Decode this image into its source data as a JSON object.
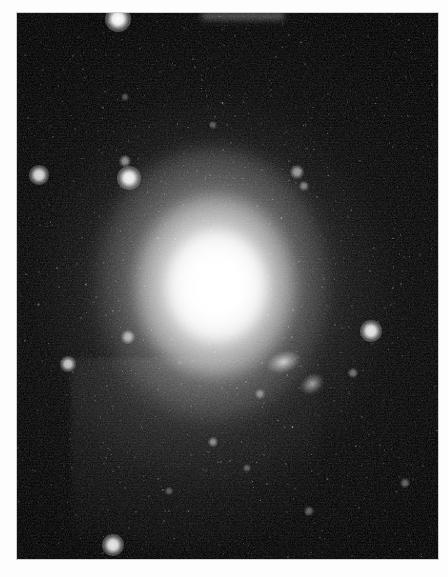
{
  "image": {
    "kind": "astronomical-photograph",
    "subject": "elliptical galaxy",
    "orientation": "portrait",
    "width": 448,
    "height": 577,
    "border": {
      "style": "white photographic matte",
      "color": "#fdfdfd",
      "edge_color": "#cfcfcf",
      "left": 17,
      "top": 13,
      "right": 10,
      "bottom": 18
    },
    "plate": {
      "background_color": "#000000",
      "left": 17,
      "top": 13,
      "width": 421,
      "height": 546,
      "texture": "grainy photographic emulsion noise"
    }
  },
  "galaxy": {
    "name": "central-elliptical-galaxy",
    "center_x": 208,
    "center_y": 283,
    "core_color": "#ffffff",
    "halo_color": "#787878",
    "shape": "elliptical / slightly elongated north-south",
    "halo_radius_x": 170,
    "halo_radius_y": 191,
    "description": "Bright saturated white nucleus fading smoothly into an extended diffuse elliptical halo"
  },
  "artifacts": {
    "detector_glow": {
      "name": "detector-artifact-region",
      "left": 54,
      "top": 345,
      "width": 250,
      "height": 200,
      "note": "Rectangular region of elevated background noise in the lower-left quadrant"
    },
    "edge_streak": {
      "name": "plate-edge-streak",
      "left": 185,
      "top": 0,
      "width": 82,
      "height": 9,
      "note": "Bright horizontal smear along the upper plate edge"
    }
  },
  "stars": [
    {
      "name": "star-upper-left-bright",
      "x": 101,
      "y": 6,
      "size": 11,
      "brightness": 1.0
    },
    {
      "name": "star-left-mid",
      "x": 22,
      "y": 162,
      "size": 8,
      "brightness": 0.85
    },
    {
      "name": "star-upper-center-left",
      "x": 112,
      "y": 165,
      "size": 10,
      "brightness": 0.95
    },
    {
      "name": "star-upper-center-faint",
      "x": 108,
      "y": 148,
      "size": 5,
      "brightness": 0.5
    },
    {
      "name": "star-right-upper-faint",
      "x": 280,
      "y": 159,
      "size": 6,
      "brightness": 0.55
    },
    {
      "name": "star-right-upper-small",
      "x": 287,
      "y": 173,
      "size": 4,
      "brightness": 0.42
    },
    {
      "name": "star-right-bright",
      "x": 354,
      "y": 318,
      "size": 9,
      "brightness": 0.9
    },
    {
      "name": "star-left-lower",
      "x": 51,
      "y": 351,
      "size": 7,
      "brightness": 0.75
    },
    {
      "name": "star-mid-left",
      "x": 111,
      "y": 324,
      "size": 6,
      "brightness": 0.6
    },
    {
      "name": "star-bottom-left",
      "x": 96,
      "y": 532,
      "size": 9,
      "brightness": 0.9
    },
    {
      "name": "star-center-faint-a",
      "x": 196,
      "y": 429,
      "size": 4,
      "brightness": 0.45
    },
    {
      "name": "star-center-faint-b",
      "x": 243,
      "y": 381,
      "size": 4,
      "brightness": 0.4
    },
    {
      "name": "star-right-faint-a",
      "x": 336,
      "y": 360,
      "size": 4,
      "brightness": 0.38
    },
    {
      "name": "star-right-faint-b",
      "x": 388,
      "y": 470,
      "size": 4,
      "brightness": 0.35
    },
    {
      "name": "star-top-faint-a",
      "x": 196,
      "y": 112,
      "size": 3,
      "brightness": 0.3
    },
    {
      "name": "star-top-faint-b",
      "x": 108,
      "y": 84,
      "size": 3,
      "brightness": 0.28
    },
    {
      "name": "star-bottom-faint-a",
      "x": 292,
      "y": 498,
      "size": 4,
      "brightness": 0.33
    },
    {
      "name": "star-bottom-faint-b",
      "x": 152,
      "y": 478,
      "size": 3,
      "brightness": 0.3
    },
    {
      "name": "star-lower-center",
      "x": 230,
      "y": 455,
      "size": 3,
      "brightness": 0.3
    }
  ],
  "companion_objects": [
    {
      "name": "companion-galaxy-upper",
      "x": 266,
      "y": 349,
      "width": 15,
      "height": 9,
      "angle": -18,
      "brightness": 0.8
    },
    {
      "name": "companion-galaxy-lower",
      "x": 295,
      "y": 371,
      "width": 11,
      "height": 8,
      "angle": -35,
      "brightness": 0.65
    }
  ]
}
